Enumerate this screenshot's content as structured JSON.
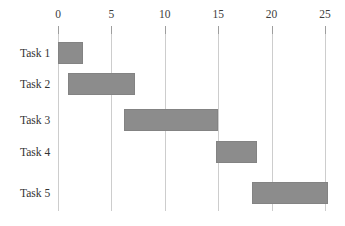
{
  "chart_data": {
    "type": "bar",
    "variant": "gantt",
    "title": "",
    "xlabel": "",
    "ylabel": "",
    "axis_position": "top",
    "grid": true,
    "legend": "none",
    "x_ticks": [
      0,
      5,
      10,
      15,
      20,
      25
    ],
    "xlim": [
      0,
      25.5
    ],
    "categories": [
      "Task 1",
      "Task 2",
      "Task 3",
      "Task 4",
      "Task 5"
    ],
    "tasks": [
      {
        "label": "Task 1",
        "start": 0,
        "end": 2.3
      },
      {
        "label": "Task 2",
        "start": 0.9,
        "end": 7.2
      },
      {
        "label": "Task 3",
        "start": 6.2,
        "end": 15.0
      },
      {
        "label": "Task 4",
        "start": 14.8,
        "end": 18.6
      },
      {
        "label": "Task 5",
        "start": 18.2,
        "end": 25.3
      }
    ],
    "colors": {
      "bar_fill": "#8c8c8c",
      "bar_edge": "#838383",
      "gridline": "#cdcdcd",
      "tick": "#9e9e9e",
      "text": "#3d3d3d",
      "background": "#ffffff"
    }
  }
}
